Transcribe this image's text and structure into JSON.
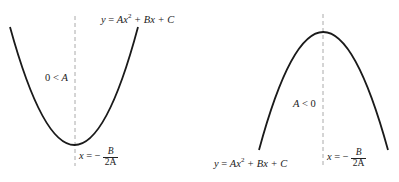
{
  "diagrams": [
    {
      "name": "upward-parabola",
      "condition": "0 < A",
      "equation": "y = Ax² + Bx + C",
      "equation_parts": {
        "lhs": "y",
        "eq": " = ",
        "a": "Ax",
        "exp": "2",
        "rest": " + Bx + C"
      },
      "axis_label": {
        "lhs": "x",
        "eq": " = −",
        "num": "B",
        "den": "2A"
      },
      "condition_parts": {
        "zero": "0",
        "lt": " < ",
        "var": "A"
      }
    },
    {
      "name": "downward-parabola",
      "condition": "A < 0",
      "equation": "y = Ax² + Bx + C",
      "equation_parts": {
        "lhs": "y",
        "eq": " = ",
        "a": "Ax",
        "exp": "2",
        "rest": " + Bx + C"
      },
      "axis_label": {
        "lhs": "x",
        "eq": " = −",
        "num": "B",
        "den": "2A"
      },
      "condition_parts": {
        "var": "A",
        "lt": " < ",
        "zero": "0"
      }
    }
  ],
  "colors": {
    "curve": "#1a1a1a",
    "axis": "#aaaaaa",
    "text": "#222222"
  }
}
